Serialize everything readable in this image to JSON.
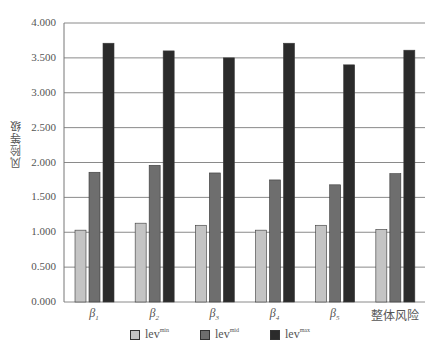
{
  "chart_data": {
    "type": "bar",
    "title": "",
    "xlabel": "",
    "ylabel": "风险等级",
    "ylim": [
      0,
      4
    ],
    "yticks": [
      "0.000",
      "0.500",
      "1.000",
      "1.500",
      "2.000",
      "2.500",
      "3.000",
      "3.500",
      "4.000"
    ],
    "grid": true,
    "legend_position": "bottom",
    "categories": [
      "β1",
      "β2",
      "β3",
      "β4",
      "β5",
      "整体风险"
    ],
    "category_labels": [
      {
        "base": "β",
        "sub": "1"
      },
      {
        "base": "β",
        "sub": "2"
      },
      {
        "base": "β",
        "sub": "3"
      },
      {
        "base": "β",
        "sub": "4"
      },
      {
        "base": "β",
        "sub": "5"
      },
      {
        "base": "整体风险",
        "sub": ""
      }
    ],
    "series": [
      {
        "name": "lev^min",
        "base": "lev",
        "sup": "min",
        "color": "#c4c4c4",
        "values": [
          1.03,
          1.13,
          1.1,
          1.03,
          1.1,
          1.04
        ]
      },
      {
        "name": "lev^mid",
        "base": "lev",
        "sup": "mid",
        "color": "#6e6e6e",
        "values": [
          1.86,
          1.96,
          1.85,
          1.75,
          1.68,
          1.84
        ]
      },
      {
        "name": "lev^max",
        "base": "lev",
        "sup": "max",
        "color": "#2b2b2b",
        "values": [
          3.71,
          3.6,
          3.5,
          3.71,
          3.4,
          3.61
        ]
      }
    ]
  },
  "colors": {
    "gridline": "#8a8a8a",
    "axis": "#777777",
    "bar_border": "#3a3a3a"
  }
}
